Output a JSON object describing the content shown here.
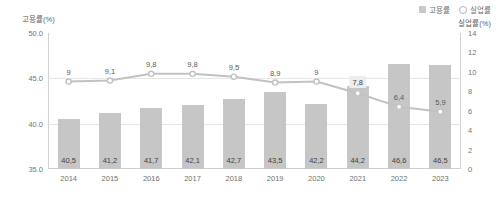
{
  "chart_data": {
    "type": "bar",
    "title": "",
    "xlabel": "",
    "ylabel": "고용률(%)",
    "y2label": "실업률(%)",
    "categories": [
      "2014",
      "2015",
      "2016",
      "2017",
      "2018",
      "2019",
      "2020",
      "2021",
      "2022",
      "2023"
    ],
    "ylim": [
      35.0,
      50.0
    ],
    "y2lim": [
      0,
      14
    ],
    "yticks": [
      "35.0",
      "40.0",
      "45.0",
      "50.0"
    ],
    "y2ticks": [
      "0",
      "2",
      "4",
      "6",
      "8",
      "10",
      "12",
      "14"
    ],
    "grid": true,
    "legend_position": "top-right",
    "series": [
      {
        "name": "고용률",
        "type": "bar",
        "axis": "left",
        "color": "#c6c6c6",
        "values": [
          40.5,
          41.2,
          41.7,
          42.1,
          42.7,
          43.5,
          42.2,
          44.2,
          46.6,
          46.5
        ],
        "labels": [
          "40,5",
          "41,2",
          "41,7",
          "42,1",
          "42,7",
          "43,5",
          "42,2",
          "44,2",
          "46,6",
          "46,5"
        ]
      },
      {
        "name": "실업률",
        "type": "line",
        "axis": "right",
        "color": "#c2c2c2",
        "values": [
          9,
          9.1,
          9.8,
          9.8,
          9.5,
          8.9,
          9,
          7.8,
          6.4,
          5.9
        ],
        "labels": [
          "9",
          "9,1",
          "9,8",
          "9,8",
          "9,5",
          "8,9",
          "9",
          "7,8",
          "6,4",
          "5,9"
        ],
        "highlighted_index": 7
      }
    ]
  },
  "legend": {
    "items": [
      {
        "label": "고용률",
        "marker": "bar-swatch-icon"
      },
      {
        "label": "실업률",
        "marker": "circle-marker-icon"
      }
    ]
  },
  "colors": {
    "bar": "#c6c6c6",
    "line": "#c2c2c2",
    "grid": "#e6e6e6",
    "axis": "#cfcfcf",
    "label_box": "#ededed"
  }
}
